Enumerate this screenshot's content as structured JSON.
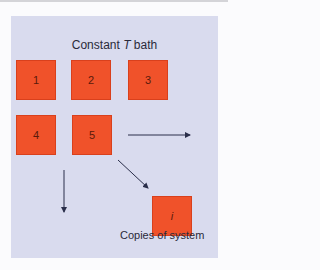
{
  "diagram": {
    "title_prefix": "Constant ",
    "title_var": "T",
    "title_suffix": " bath",
    "boxes": [
      {
        "label": "1"
      },
      {
        "label": "2"
      },
      {
        "label": "3"
      },
      {
        "label": "4"
      },
      {
        "label": "5"
      },
      {
        "label": "i"
      }
    ],
    "caption": "Copies of system",
    "colors": {
      "panel": "#d9dbee",
      "box": "#f0522a",
      "arrow": "#2a2e4a"
    }
  }
}
